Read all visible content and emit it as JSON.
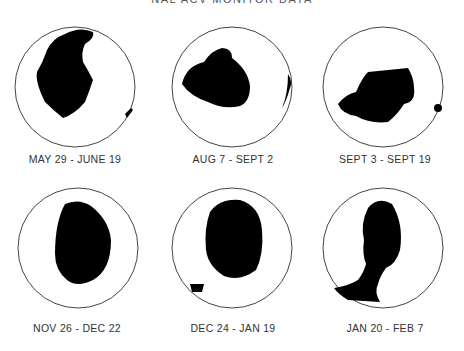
{
  "title": "NAL ACV MONITOR DATA",
  "panels": [
    {
      "label": "MAY 29 - JUNE 19"
    },
    {
      "label": "AUG 7 - SEPT 2"
    },
    {
      "label": "SEPT 3 - SEPT 19"
    },
    {
      "label": "NOV 26 - DEC 22"
    },
    {
      "label": "DEC 24 - JAN 19"
    },
    {
      "label": "JAN 20 - FEB 7"
    }
  ],
  "colors": {
    "fill": "#000000",
    "outline": "#444444",
    "background": "#ffffff"
  }
}
